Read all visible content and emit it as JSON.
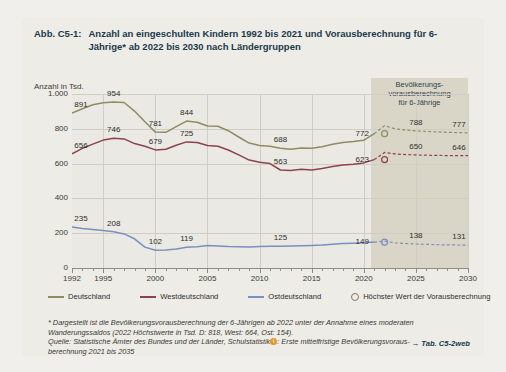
{
  "figure": {
    "number": "Abb. C5-1:",
    "title": "Anzahl an eingeschulten Kindern 1992 bis 2021 und Vorausberechnung für 6-Jährige* ab 2022 bis 2030 nach Ländergruppen",
    "table_reference": "→ Tab. C5-2web"
  },
  "band": {
    "label": "Bevölkerungs-\nvorausberechnung\nfür 6-Jährige",
    "color": "#d9d6c8",
    "start_year": 2022,
    "end_year": 2030
  },
  "legend": {
    "items": [
      {
        "label": "Deutschland",
        "color": "#8d8d63",
        "marker": "line"
      },
      {
        "label": "Westdeutschland",
        "color": "#8e4250",
        "marker": "line"
      },
      {
        "label": "Ostdeutschland",
        "color": "#7b8fc0",
        "marker": "line"
      },
      {
        "label": "Höchster Wert der Vorausberechnung",
        "color": "#7b7b72",
        "marker": "circle"
      }
    ]
  },
  "footnotes": {
    "lines": [
      "* Dargestellt ist die Bevölkerungsvorausberechnung der 6-Jährigen ab 2022 unter der Annahme eines moderaten",
      "Wanderungssaldos (2022 Höchstwerte in Tsd. D: 818, West: 664, Ost: 154).",
      "Quelle: Statistische Ämter des Bundes und der Länder, Schulstatistik ⬤: Erste mittelfristige Bevölkerungsvoraus-",
      "berechnung 2021 bis 2035"
    ],
    "source_prefix": "Quelle: Statistische Ämter des Bundes und der Länder, Schulstatistik",
    "source_badge": "i",
    "source_suffix": ": Erste mittelfristige Bevölkerungsvoraus-",
    "source_last": "berechnung 2021 bis 2035"
  },
  "chart_data": {
    "type": "line",
    "title": "Anzahl an eingeschulten Kindern 1992 bis 2021 und Vorausberechnung für 6-Jährige* ab 2022 bis 2030 nach Ländergruppen",
    "ylabel": "Anzahl in Tsd.",
    "xlabel": "",
    "ylim": [
      0,
      1000
    ],
    "xlim": [
      1992,
      2030
    ],
    "yticks": [
      "0",
      "200",
      "400",
      "600",
      "800",
      "1.000"
    ],
    "ytick_values": [
      0,
      200,
      400,
      600,
      800,
      1000
    ],
    "xticks": [
      "1992",
      "1995",
      "2000",
      "2005",
      "2010",
      "2015",
      "2020",
      "2025",
      "2030"
    ],
    "xtick_values": [
      1992,
      1995,
      2000,
      2005,
      2010,
      2015,
      2020,
      2025,
      2030
    ],
    "grid": true,
    "legend_position": "bottom",
    "series": [
      {
        "name": "Deutschland",
        "color": "#8d8d63",
        "x": [
          1992,
          1993,
          1994,
          1995,
          1996,
          1997,
          1998,
          1999,
          2000,
          2001,
          2002,
          2003,
          2004,
          2005,
          2006,
          2007,
          2008,
          2009,
          2010,
          2011,
          2012,
          2013,
          2014,
          2015,
          2016,
          2017,
          2018,
          2019,
          2020,
          2021
        ],
        "values": [
          891,
          915,
          938,
          950,
          954,
          951,
          902,
          840,
          781,
          780,
          812,
          844,
          838,
          816,
          815,
          789,
          753,
          718,
          704,
          700,
          688,
          683,
          689,
          688,
          697,
          711,
          722,
          727,
          734,
          772
        ],
        "labels": [
          {
            "x": 1992,
            "value": 891
          },
          {
            "x": 1996,
            "value": 954
          },
          {
            "x": 2000,
            "value": 781
          },
          {
            "x": 2003,
            "value": 844
          },
          {
            "x": 2012,
            "value": 688
          },
          {
            "x": 2021,
            "value": 772
          }
        ],
        "forecast": {
          "x": [
            2022,
            2023,
            2024,
            2025,
            2026,
            2027,
            2028,
            2029,
            2030
          ],
          "values": [
            818,
            800,
            793,
            788,
            785,
            782,
            780,
            778,
            777
          ],
          "labels": [
            {
              "x": 2025,
              "value": 788
            },
            {
              "x": 2030,
              "value": 777
            }
          ],
          "marker_x": 2022,
          "marker_value": 772
        }
      },
      {
        "name": "Westdeutschland",
        "color": "#8e4250",
        "x": [
          1992,
          1993,
          1994,
          1995,
          1996,
          1997,
          1998,
          1999,
          2000,
          2001,
          2002,
          2003,
          2004,
          2005,
          2006,
          2007,
          2008,
          2009,
          2010,
          2011,
          2012,
          2013,
          2014,
          2015,
          2016,
          2017,
          2018,
          2019,
          2020,
          2021
        ],
        "values": [
          656,
          688,
          712,
          735,
          746,
          742,
          715,
          700,
          679,
          682,
          705,
          725,
          721,
          704,
          700,
          678,
          650,
          620,
          608,
          600,
          563,
          560,
          567,
          563,
          572,
          583,
          592,
          596,
          604,
          623
        ],
        "labels": [
          {
            "x": 1992,
            "value": 656
          },
          {
            "x": 1996,
            "value": 746
          },
          {
            "x": 2000,
            "value": 679
          },
          {
            "x": 2003,
            "value": 725
          },
          {
            "x": 2012,
            "value": 563
          },
          {
            "x": 2021,
            "value": 623
          }
        ],
        "forecast": {
          "x": [
            2022,
            2023,
            2024,
            2025,
            2026,
            2027,
            2028,
            2029,
            2030
          ],
          "values": [
            664,
            656,
            652,
            650,
            648,
            647,
            646,
            646,
            646
          ],
          "labels": [
            {
              "x": 2025,
              "value": 650
            },
            {
              "x": 2030,
              "value": 646
            }
          ],
          "marker_x": 2022,
          "marker_value": 623
        }
      },
      {
        "name": "Ostdeutschland",
        "color": "#7b8fc0",
        "x": [
          1992,
          1993,
          1994,
          1995,
          1996,
          1997,
          1998,
          1999,
          2000,
          2001,
          2002,
          2003,
          2004,
          2005,
          2006,
          2007,
          2008,
          2009,
          2010,
          2011,
          2012,
          2013,
          2014,
          2015,
          2016,
          2017,
          2018,
          2019,
          2020,
          2021
        ],
        "values": [
          235,
          227,
          222,
          215,
          208,
          196,
          168,
          120,
          102,
          104,
          110,
          119,
          122,
          129,
          127,
          123,
          122,
          120,
          124,
          125,
          125,
          126,
          128,
          130,
          132,
          136,
          140,
          142,
          145,
          149
        ],
        "labels": [
          {
            "x": 1992,
            "value": 235
          },
          {
            "x": 1996,
            "value": 208
          },
          {
            "x": 2000,
            "value": 102
          },
          {
            "x": 2003,
            "value": 119
          },
          {
            "x": 2012,
            "value": 125
          },
          {
            "x": 2021,
            "value": 149
          }
        ],
        "forecast": {
          "x": [
            2022,
            2023,
            2024,
            2025,
            2026,
            2027,
            2028,
            2029,
            2030
          ],
          "values": [
            154,
            145,
            141,
            138,
            136,
            134,
            133,
            132,
            131
          ],
          "labels": [
            {
              "x": 2025,
              "value": 138
            },
            {
              "x": 2030,
              "value": 131
            }
          ],
          "marker_x": 2022,
          "marker_value": 149
        }
      }
    ]
  }
}
